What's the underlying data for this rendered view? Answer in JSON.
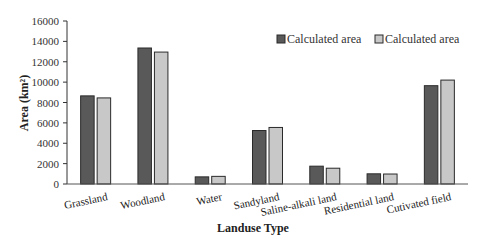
{
  "chart_data": {
    "type": "bar",
    "title": "",
    "xlabel": "Landuse Type",
    "ylabel": "Area (km²)",
    "ylim": [
      0,
      16000
    ],
    "yticks": [
      0,
      2000,
      4000,
      6000,
      8000,
      10000,
      12000,
      14000,
      16000
    ],
    "grid": false,
    "legend_position": "top-right",
    "categories": [
      "Grassland",
      "Woodland",
      "Water",
      "Sandyland",
      "Saline-alkali land",
      "Residential land",
      "Cutivated field"
    ],
    "series": [
      {
        "name": "Calculated area",
        "color": "#595959",
        "values": [
          8650,
          13350,
          700,
          5250,
          1750,
          1000,
          9650
        ]
      },
      {
        "name": "Calculated area",
        "color": "#c8c8c8",
        "values": [
          8450,
          12950,
          750,
          5550,
          1550,
          980,
          10200
        ]
      }
    ]
  },
  "colors": {
    "axis": "#333333",
    "bar_border": "#2a2a2a"
  }
}
